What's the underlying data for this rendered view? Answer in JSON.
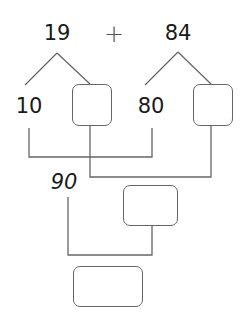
{
  "problem": {
    "addend_1": "19",
    "operator": "+",
    "addend_2": "84"
  },
  "partition_1": {
    "tens": "10",
    "ones_box": ""
  },
  "partition_2": {
    "tens": "80",
    "ones_box": ""
  },
  "tens_sum": "90",
  "ones_sum_box": "",
  "total_box": "",
  "colors": {
    "text": "#1a1a1a",
    "line": "#666666",
    "background": "#ffffff"
  }
}
